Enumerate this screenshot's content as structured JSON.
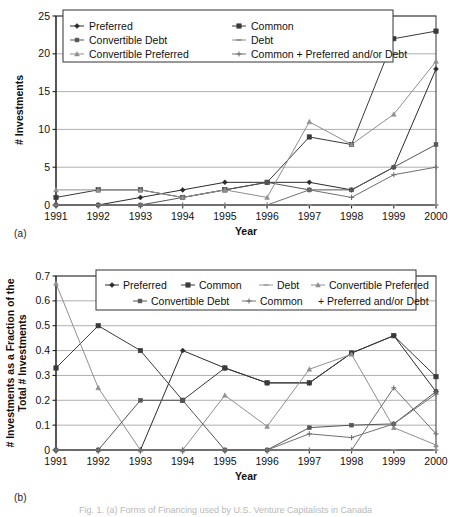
{
  "figure": {
    "panel_a_tag": "(a)",
    "panel_b_tag": "(b)",
    "caption_partial": "Fig. 1. (a) Forms of Financing used by U.S. Venture Capitalists in Canada"
  },
  "chart_data": [
    {
      "id": "chart-a",
      "type": "line",
      "title": "",
      "xlabel": "Year",
      "ylabel": "# Investments",
      "categories": [
        "1991",
        "1992",
        "1993",
        "1994",
        "1995",
        "1996",
        "1997",
        "1998",
        "1999",
        "2000"
      ],
      "xlim": [
        0,
        9
      ],
      "ylim": [
        0,
        25
      ],
      "yticks": [
        0,
        5,
        10,
        15,
        20,
        25
      ],
      "ytick_labels": [
        "0",
        "5",
        "10",
        "15",
        "20",
        "25"
      ],
      "grid": true,
      "legend_position": "top-left-inside",
      "legend_columns": 2,
      "series": [
        {
          "name": "Preferred",
          "marker": "diamond",
          "color": "#2b2b2b",
          "values": [
            0,
            0,
            1,
            2,
            3,
            3,
            3,
            2,
            5,
            18
          ]
        },
        {
          "name": "Common",
          "marker": "square",
          "color": "#3a3a3a",
          "values": [
            1,
            2,
            2,
            1,
            2,
            3,
            9,
            8,
            22,
            23
          ]
        },
        {
          "name": "Convertible Debt",
          "marker": "square-small",
          "color": "#555555",
          "values": [
            0,
            0,
            0,
            1,
            2,
            3,
            2,
            2,
            5,
            8
          ]
        },
        {
          "name": "Debt",
          "marker": "dash",
          "color": "#8a8a8a",
          "values": [
            0,
            0,
            0,
            0,
            0,
            0,
            0,
            0,
            0,
            0
          ]
        },
        {
          "name": "Convertible Preferred",
          "marker": "triangle",
          "color": "#8f8f8f",
          "values": [
            2,
            2,
            2,
            1,
            2,
            1,
            11,
            8,
            12,
            19
          ]
        },
        {
          "name": "Common + Preferred and/or Debt",
          "marker": "plus",
          "color": "#707070",
          "values": [
            0,
            0,
            0,
            0,
            0,
            0,
            2,
            1,
            4,
            5
          ]
        }
      ]
    },
    {
      "id": "chart-b",
      "type": "line",
      "title": "",
      "xlabel": "Year",
      "ylabel": "# Investments as a Fraction of the Total # Investments",
      "categories": [
        "1991",
        "1992",
        "1993",
        "1994",
        "1995",
        "1996",
        "1997",
        "1998",
        "1999",
        "2000"
      ],
      "xlim": [
        0,
        9
      ],
      "ylim": [
        0,
        0.7
      ],
      "yticks": [
        0,
        0.1,
        0.2,
        0.3,
        0.4,
        0.5,
        0.6,
        0.7
      ],
      "ytick_labels": [
        "0",
        "0.1",
        "0.2",
        "0.3",
        "0.4",
        "0.5",
        "0.6",
        "0.7"
      ],
      "grid": true,
      "legend_position": "top-center-inside",
      "legend_columns": 4,
      "series": [
        {
          "name": "Preferred",
          "marker": "diamond",
          "color": "#2b2b2b",
          "values": [
            0.0,
            0.0,
            0.0,
            0.4,
            0.33,
            0.27,
            0.27,
            0.39,
            0.46,
            0.235
          ]
        },
        {
          "name": "Common",
          "marker": "square",
          "color": "#3a3a3a",
          "values": [
            0.33,
            0.5,
            0.4,
            0.2,
            0.33,
            0.27,
            0.27,
            0.39,
            0.46,
            0.295
          ]
        },
        {
          "name": "Debt",
          "marker": "dash",
          "color": "#9a9a9a",
          "values": [
            0.0,
            0.0,
            0.0,
            0.0,
            0.0,
            0.0,
            0.0,
            0.0,
            0.0,
            0.0
          ]
        },
        {
          "name": "Convertible Preferred",
          "marker": "triangle",
          "color": "#8f8f8f",
          "values": [
            0.67,
            0.25,
            0.0,
            0.0,
            0.22,
            0.095,
            0.325,
            0.385,
            0.09,
            0.02
          ]
        },
        {
          "name": "Convertible Debt",
          "marker": "square-small",
          "color": "#555555",
          "values": [
            0.0,
            0.0,
            0.2,
            0.2,
            0.0,
            0.0,
            0.09,
            0.1,
            0.105,
            0.235
          ]
        },
        {
          "name": "Common",
          "marker": "plus",
          "color": "#707070",
          "values": [
            0.0,
            0.0,
            0.0,
            0.0,
            0.0,
            0.0,
            0.065,
            0.05,
            0.105,
            0.225
          ]
        },
        {
          "name": "Preferred and/or Debt",
          "marker": "plus-bare",
          "color": "#6f6f6f",
          "values": [
            0.0,
            0.0,
            0.0,
            0.0,
            0.0,
            0.0,
            0.0,
            0.0,
            0.25,
            0.065
          ]
        }
      ]
    }
  ],
  "chart_a": {
    "legend": [
      {
        "label": "Preferred"
      },
      {
        "label": "Common"
      },
      {
        "label": "Convertible Debt"
      },
      {
        "label": "Debt"
      },
      {
        "label": "Convertible Preferred"
      },
      {
        "label": "Common + Preferred and/or Debt"
      }
    ]
  },
  "chart_b": {
    "legend": [
      {
        "label": "Preferred"
      },
      {
        "label": "Common"
      },
      {
        "label": "Debt"
      },
      {
        "label": "Convertible Preferred"
      },
      {
        "label": "Convertible Debt"
      },
      {
        "label": "Common"
      },
      {
        "label": "+ Preferred and/or Debt"
      }
    ]
  }
}
